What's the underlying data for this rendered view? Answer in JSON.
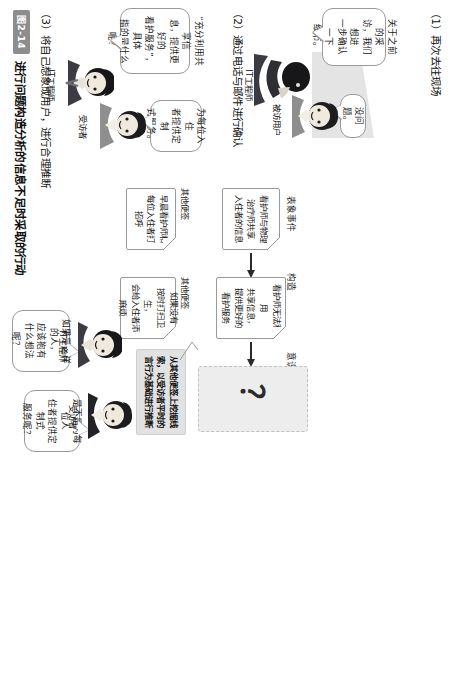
{
  "figure": {
    "badge": "图2-14",
    "caption": "进行问题构造分析的信息不足时采取的行动"
  },
  "sections": [
    {
      "id": "s1",
      "heading": "（1）再次去往现场"
    },
    {
      "id": "s2",
      "heading": "（2）通过电话与邮件进行确认"
    },
    {
      "id": "s3",
      "heading": "（3）将自己想象成用户，进行合理推断"
    }
  ],
  "section1": {
    "engineer_label": "IT工程师",
    "user_label": "被访用户",
    "engineer_bubble": "关于之前的采\n访，我们想进\n一步确认一下\n细节。",
    "user_bubble": "没问题。"
  },
  "section2": {
    "engineer_label": "IT工程师",
    "interviewee_label": "受访者",
    "engineer_bubble": "“充分利用共享信\n息，提供更好的\n看护服务”，具体\n指的是什么呢？",
    "interviewee_bubble": "为每位入住\n者提供定制\n式服务。"
  },
  "section3": {
    "engineer_label": "IT工程师",
    "interviewee_label": "受访者",
    "engineer_bubble": "如果是这样的人，\n应该抱有\n什么想法呢？",
    "interviewee_bubble": "是不是为每位人\n住者提供定制式\n服务呢？",
    "column_headers": [
      "表象事件",
      "构造",
      "意识"
    ],
    "chain": [
      {
        "text": "看护师与物理\n治疗师共享\n入住者的信息"
      },
      {
        "text": "看护师无法利用\n共享信息，\n提供更好的\n看护服务"
      },
      {
        "text": "？"
      }
    ],
    "note_label": "其他便签",
    "other_notes": [
      "早晨看护师和\n每位入住者打招呼",
      "如果没有\n按时打扫卫生，\n会给入住者添麻烦"
    ],
    "insight_note": "从其他便签上挖掘线\n索，以受访者平时的\n言行为基础进行推断"
  },
  "colors": {
    "badge_bg": "#8d8d8d",
    "note_border": "#9a9a9a",
    "gray_note_bg": "#e2e2e2",
    "dashed_note_bg": "#ededed",
    "arrow": "#2a2a2a",
    "floor": "#d5d5d5"
  }
}
